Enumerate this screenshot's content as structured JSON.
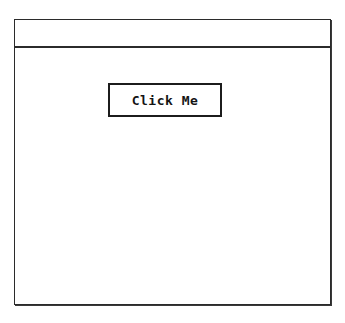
{
  "window": {
    "title": "",
    "controls": [],
    "colors": {
      "background": "#ffffff",
      "border": "#2b2b2b",
      "text": "#141414"
    }
  },
  "content": {
    "button": {
      "label": "Click Me",
      "name": "click-me-button"
    },
    "body_text": ""
  }
}
